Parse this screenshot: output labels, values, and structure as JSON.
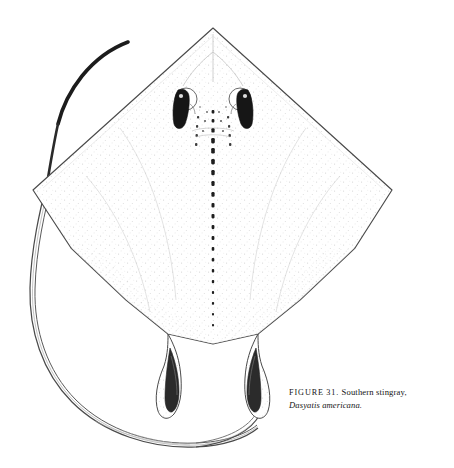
{
  "figure": {
    "label": "FIGURE",
    "number": "31.",
    "common_name": "Southern stingray,",
    "species": "Dasyatis americana.",
    "caption_full": "FIGURE 31. Southern stingray, Dasyatis americana.",
    "illustration_style": "stippled-line-drawing",
    "colors": {
      "background": "#ffffff",
      "outline": "#3a3a3a",
      "stipple": "#c8c8c8",
      "dark_marking": "#1a1a1a",
      "caption_text": "#141414"
    },
    "anatomy": [
      {
        "name": "pectoral-disc",
        "description": "diamond-shaped stippled disc"
      },
      {
        "name": "snout-apex",
        "description": "pointed anterior tip of disc"
      },
      {
        "name": "left-eye",
        "description": "dark elongate eye with spiracle"
      },
      {
        "name": "right-eye",
        "description": "dark elongate eye with spiracle"
      },
      {
        "name": "midline-tubercle-row",
        "description": "dashed row of dark denticles along midline"
      },
      {
        "name": "left-pelvic-fin",
        "description": "posterior left pelvic lobe"
      },
      {
        "name": "right-pelvic-fin",
        "description": "posterior right pelvic lobe"
      },
      {
        "name": "left-clasper",
        "description": "elongate left clasper"
      },
      {
        "name": "right-clasper",
        "description": "elongate right clasper"
      },
      {
        "name": "whip-tail",
        "description": "long whip-like tail looping left and beneath the disc"
      },
      {
        "name": "tail-tip",
        "description": "thickened dark distal tail tip at upper left"
      }
    ]
  }
}
